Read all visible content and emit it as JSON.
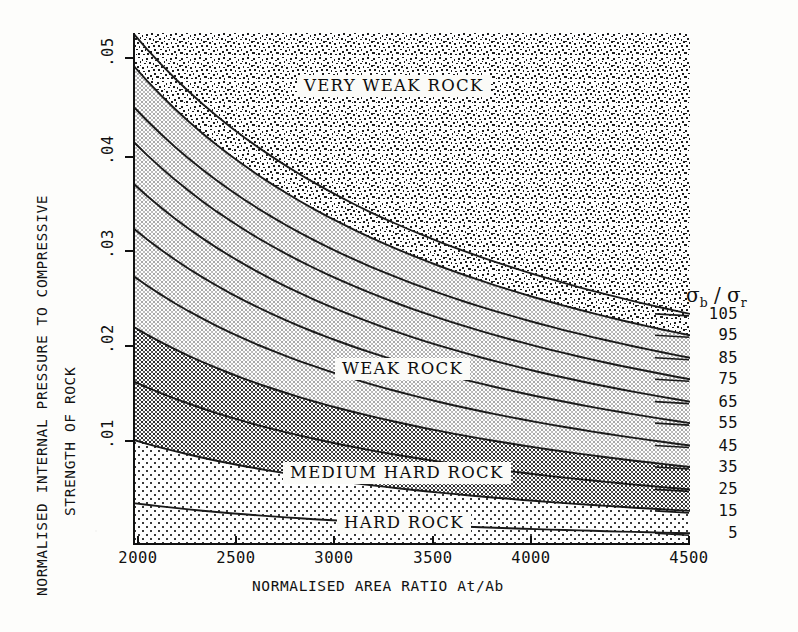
{
  "chart_data": {
    "type": "line",
    "title": "",
    "xlabel": "NORMALISED AREA RATIO  At/Ab",
    "ylabel_line1": "NORMALISED INTERNAL PRESSURE TO COMPRESSIVE",
    "ylabel_line2": "STRENGTH OF ROCK",
    "xlim": [
      1900,
      4500
    ],
    "ylim": [
      0,
      0.0525
    ],
    "xticks": [
      2000,
      2500,
      3000,
      3500,
      4000,
      4500
    ],
    "xticklabels": [
      "2000",
      "2500",
      "3000",
      "3500",
      "4000",
      "4500"
    ],
    "yticks": [
      0.01,
      0.02,
      0.03,
      0.04,
      0.05
    ],
    "yticklabels": [
      ".01",
      ".02",
      ".03",
      ".04",
      ".05"
    ],
    "grid": false,
    "legend_position": "right",
    "series_label": "σb / σr",
    "series": [
      {
        "name": "105",
        "y_left": 0.0525,
        "y_right": 0.0237
      },
      {
        "name": "95",
        "y_left": 0.0492,
        "y_right": 0.0215
      },
      {
        "name": "85",
        "y_left": 0.045,
        "y_right": 0.0192
      },
      {
        "name": "75",
        "y_left": 0.0414,
        "y_right": 0.017
      },
      {
        "name": "65",
        "y_left": 0.0371,
        "y_right": 0.0147
      },
      {
        "name": "55",
        "y_left": 0.0325,
        "y_right": 0.0125
      },
      {
        "name": "45",
        "y_left": 0.0276,
        "y_right": 0.0102
      },
      {
        "name": "35",
        "y_left": 0.0224,
        "y_right": 0.008
      },
      {
        "name": "25",
        "y_left": 0.0168,
        "y_right": 0.0057
      },
      {
        "name": "15",
        "y_left": 0.0108,
        "y_right": 0.0035
      },
      {
        "name": "5",
        "y_left": 0.0043,
        "y_right": 0.0012
      }
    ],
    "zones": [
      {
        "name": "VERY WEAK ROCK",
        "fill": "dense-noise",
        "above_curve": "95"
      },
      {
        "name": "WEAK ROCK",
        "fill": "light-check",
        "between": [
          "95",
          "35"
        ]
      },
      {
        "name": "MEDIUM HARD ROCK",
        "fill": "dark-check",
        "between": [
          "35",
          "15"
        ]
      },
      {
        "name": "HARD ROCK",
        "fill": "sparse-dots",
        "below_curve": "15"
      }
    ]
  },
  "zone_labels": [
    {
      "text": "VERY WEAK ROCK"
    },
    {
      "text": "WEAK ROCK"
    },
    {
      "text": "MEDIUM HARD ROCK"
    },
    {
      "text": "HARD ROCK"
    }
  ],
  "legend": {
    "sigma_b": "σ",
    "sub_b": "b",
    "slash": " / ",
    "sigma_r": "σ",
    "sub_r": "r",
    "values": [
      "105",
      "95",
      "85",
      "75",
      "65",
      "55",
      "45",
      "35",
      "25",
      "15",
      "5"
    ]
  },
  "colors": {
    "ink": "#111111",
    "paper": "#fdfdfb",
    "very_weak": "#8a8a8a",
    "weak": "#d8d8d8",
    "medium_hard": "#a2a2a2",
    "hard": "#f2f2f2"
  }
}
